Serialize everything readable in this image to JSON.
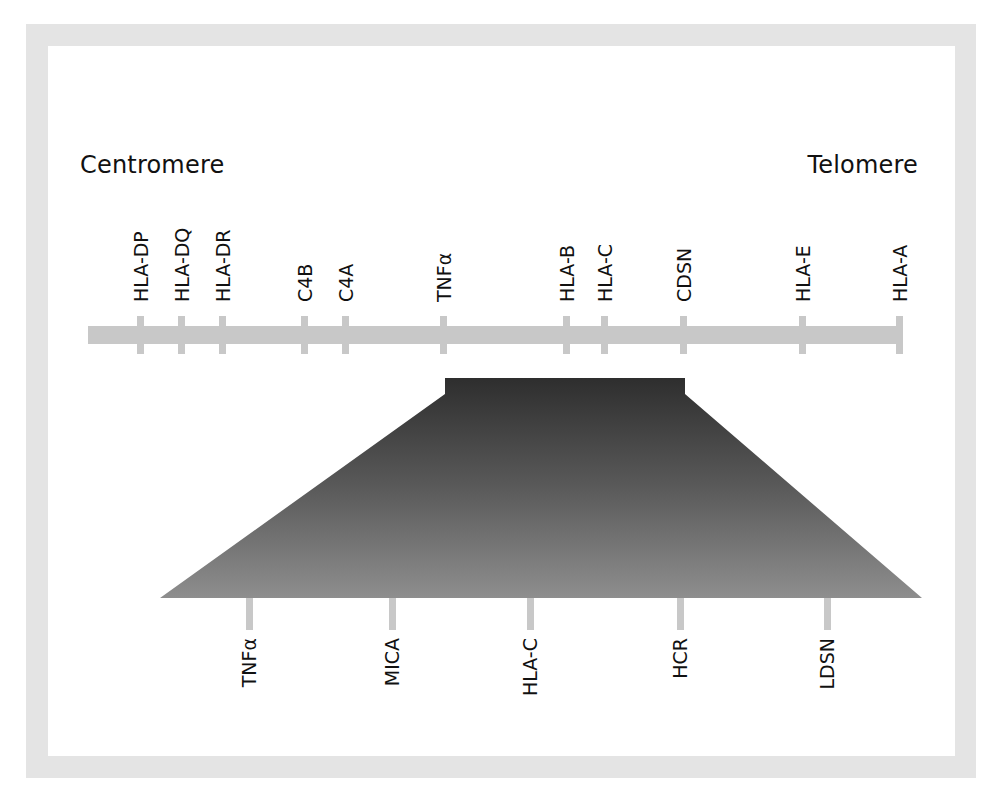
{
  "diagram": {
    "title_left": "Centromere",
    "title_right": "Telomere",
    "colors": {
      "frame": "#e4e4e4",
      "chromosome_bar": "#c8c8c8",
      "zoom_gradient_top": "#303030",
      "zoom_gradient_bottom": "#8c8c8c",
      "text": "#111111"
    },
    "chromosome_genes": [
      {
        "label": "HLA-DP",
        "x": 140
      },
      {
        "label": "HLA-DQ",
        "x": 181
      },
      {
        "label": "HLA-DR",
        "x": 222
      },
      {
        "label": "C4B",
        "x": 304
      },
      {
        "label": "C4A",
        "x": 345
      },
      {
        "label": "TNFα",
        "x": 443
      },
      {
        "label": "HLA-B",
        "x": 566
      },
      {
        "label": "HLA-C",
        "x": 604
      },
      {
        "label": "CDSN",
        "x": 683
      },
      {
        "label": "HLA-E",
        "x": 802
      },
      {
        "label": "HLA-A",
        "x": 899
      }
    ],
    "zoomed_region": {
      "from_gene": "TNFα",
      "to_gene": "CDSN",
      "genes": [
        {
          "label": "TNFα",
          "x": 249
        },
        {
          "label": "MICA",
          "x": 392
        },
        {
          "label": "HLA-C",
          "x": 530
        },
        {
          "label": "HCR",
          "x": 680
        },
        {
          "label": "LDSN",
          "x": 827
        }
      ]
    }
  }
}
